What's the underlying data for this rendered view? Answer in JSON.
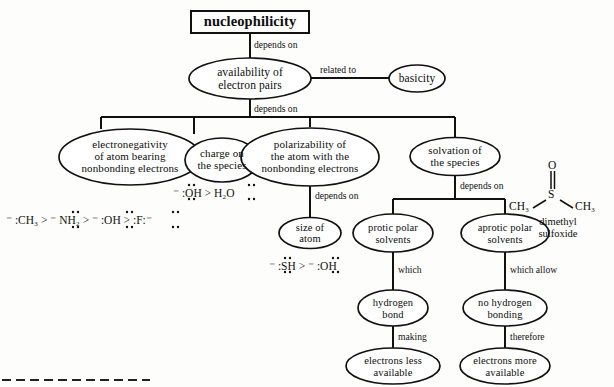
{
  "diagram": {
    "title_node": {
      "label": "nucleophilicity"
    },
    "nodes": [
      {
        "id": "availability",
        "label": "availability of\nelectron pairs"
      },
      {
        "id": "basicity",
        "label": "basicity"
      },
      {
        "id": "electronegativity",
        "label": "electronegativity\nof atom bearing\nnonbonding  electrons"
      },
      {
        "id": "charge",
        "label": "charge on\nthe species"
      },
      {
        "id": "polarizability",
        "label": "polarizability  of\nthe atom with the\nnonbonding  electrons"
      },
      {
        "id": "solvation",
        "label": "solvation of\nthe species"
      },
      {
        "id": "size",
        "label": "size of\natom"
      },
      {
        "id": "protic",
        "label": "protic  polar\nsolvents"
      },
      {
        "id": "aprotic",
        "label": "aprotic  polar\nsolvents"
      },
      {
        "id": "hbond",
        "label": "hydrogen\nbond"
      },
      {
        "id": "nohbond",
        "label": "no  hydrogen\nbonding"
      },
      {
        "id": "less",
        "label": "electrons less\navailable"
      },
      {
        "id": "more",
        "label": "electrons more\navailable"
      }
    ],
    "edge_labels": [
      {
        "id": "e1",
        "text": "depends on"
      },
      {
        "id": "e2",
        "text": "related to"
      },
      {
        "id": "e3",
        "text": "depends on"
      },
      {
        "id": "e4",
        "text": "depends on"
      },
      {
        "id": "e5",
        "text": "depends on"
      },
      {
        "id": "e6",
        "text": "which"
      },
      {
        "id": "e7",
        "text": "which allow"
      },
      {
        "id": "e8",
        "text": "making"
      },
      {
        "id": "e9",
        "text": "therefore"
      }
    ],
    "series": {
      "charge_series": "⁻ :OH  >  H₂O",
      "nucleophile_series": "⁻ :CH₃  >  ⁻ NH₂  >  ⁻ :OH  >  :F:⁻",
      "size_series": "⁻ :SH  >  ⁻ :OH"
    },
    "structure": {
      "atom_top": "O",
      "bond": "‖",
      "atom_center": "S",
      "group_left": "CH₃",
      "group_right": "CH₃",
      "name_line1": "dimethyl",
      "name_line2": "sulfoxide"
    },
    "colors": {
      "ink": "#111111",
      "paper": "#fdfdfb"
    }
  }
}
